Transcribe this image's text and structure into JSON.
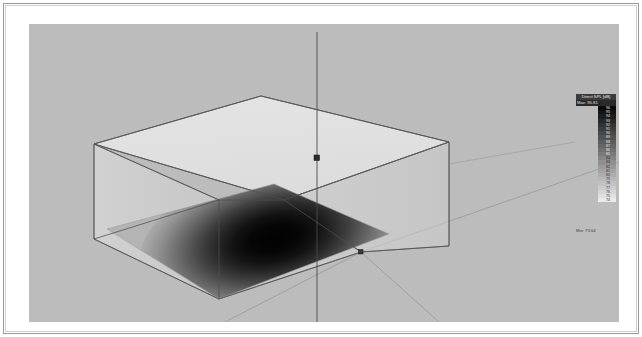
{
  "window": {
    "title": "Acoustic Simulation 3D View"
  },
  "viewport": {
    "background_color": "#bcbcbc",
    "projection": "isometric-perspective"
  },
  "legend": {
    "title": "Direct SPL [dB]",
    "max_label": "Max: 95.81",
    "min_label": "Min: 73.64",
    "title_bg": "#3a3a3a",
    "max_bg": "#2a2a2a",
    "ticks": [
      {
        "value": "96",
        "color": "#0a0a0a"
      },
      {
        "value": "95",
        "color": "#141414"
      },
      {
        "value": "94",
        "color": "#1e1e1e"
      },
      {
        "value": "93",
        "color": "#282828"
      },
      {
        "value": "92",
        "color": "#333333"
      },
      {
        "value": "91",
        "color": "#3d3d3d"
      },
      {
        "value": "90",
        "color": "#474747"
      },
      {
        "value": "89",
        "color": "#525252"
      },
      {
        "value": "88",
        "color": "#5c5c5c"
      },
      {
        "value": "87",
        "color": "#666666"
      },
      {
        "value": "86",
        "color": "#707070"
      },
      {
        "value": "85",
        "color": "#7a7a7a"
      },
      {
        "value": "84",
        "color": "#858585"
      },
      {
        "value": "83",
        "color": "#8f8f8f"
      },
      {
        "value": "82",
        "color": "#999999"
      },
      {
        "value": "81",
        "color": "#a3a3a3"
      },
      {
        "value": "80",
        "color": "#adadad"
      },
      {
        "value": "79",
        "color": "#b8b8b8"
      },
      {
        "value": "78",
        "color": "#c2c2c2"
      },
      {
        "value": "77",
        "color": "#cccccc"
      },
      {
        "value": "76",
        "color": "#d6d6d6"
      },
      {
        "value": "75",
        "color": "#e0e0e0"
      },
      {
        "value": "74",
        "color": "#ebebeb"
      }
    ]
  },
  "chart_data": {
    "type": "heatmap",
    "title": "Direct SPL [dB]",
    "quantity": "Direct Sound Pressure Level",
    "unit": "dB",
    "vmin": 73.64,
    "vmax": 95.81,
    "colormap": "grayscale-inverted",
    "surface": "floor-plane",
    "hotspot": {
      "description": "elliptical maximum region near plane centre-right",
      "center_x_norm": 0.58,
      "center_y_norm": 0.52,
      "peak_value": 95.81
    },
    "xlabel": "",
    "ylabel": "",
    "grid": false,
    "legend_position": "right"
  },
  "scene": {
    "room_box_label": "enclosure",
    "source_marker_label": "source-point",
    "corner_marker_label": "corner-point",
    "edge_color": "#5a5a5a",
    "box_fill": "#e8e8e8"
  }
}
